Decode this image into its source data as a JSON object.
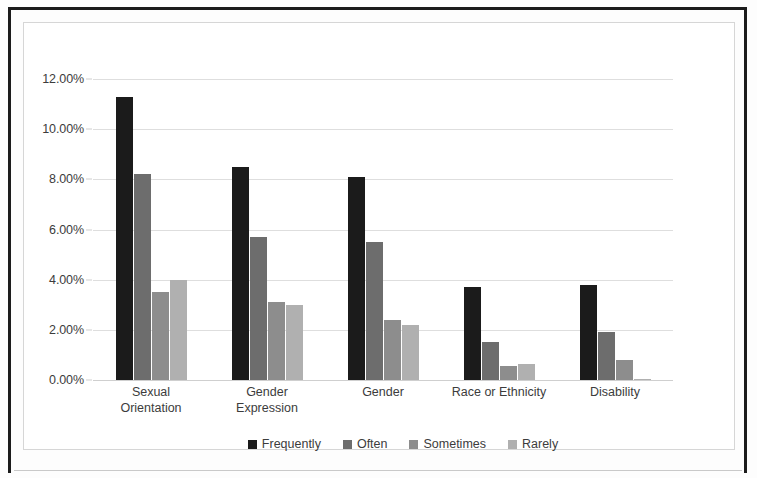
{
  "chart_data": {
    "type": "bar",
    "title": "",
    "subtitle": "",
    "xlabel": "",
    "ylabel": "",
    "grid": true,
    "legend_position": "bottom",
    "ylim": [
      0,
      12
    ],
    "ytick_labels": [
      "12.00%",
      "10.00%",
      "8.00%",
      "6.00%",
      "4.00%",
      "2.00%",
      "0.00%"
    ],
    "ytick_values": [
      12,
      10,
      8,
      6,
      4,
      2,
      0
    ],
    "categories": [
      "Sexual Orientation",
      "Gender Expression",
      "Gender",
      "Race or Ethnicity",
      "Disability"
    ],
    "category_lines": [
      [
        "Sexual",
        "Orientation"
      ],
      [
        "Gender",
        "Expression"
      ],
      [
        "Gender",
        ""
      ],
      [
        "Race or Ethnicity",
        ""
      ],
      [
        "Disability",
        ""
      ]
    ],
    "series": [
      {
        "name": "Frequently",
        "color": "#1b1b1b",
        "values": [
          11.3,
          8.5,
          8.1,
          3.7,
          3.8
        ]
      },
      {
        "name": "Often",
        "color": "#6d6d6d",
        "values": [
          8.2,
          5.7,
          5.5,
          1.5,
          1.9
        ]
      },
      {
        "name": "Sometimes",
        "color": "#8d8d8d",
        "values": [
          3.5,
          3.1,
          2.4,
          0.55,
          0.8
        ]
      },
      {
        "name": "Rarely",
        "color": "#b0b0b0",
        "values": [
          4.0,
          3.0,
          2.2,
          0.65,
          0.05
        ]
      }
    ]
  },
  "colors": {
    "page_edge": "#1c1c1c",
    "chart_border": "#d6d6d6",
    "gridline": "#dedede",
    "text": "#3c3c3c",
    "plot_background": "#ffffff"
  }
}
